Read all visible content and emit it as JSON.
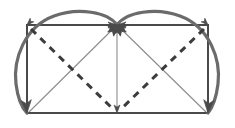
{
  "figure": {
    "canvas": {
      "width": 235,
      "height": 128,
      "background": "#ffffff"
    },
    "colors": {
      "rectangle_stroke": "#4a4a4a",
      "arc_stroke": "#6b6b6b",
      "thin_diagonal_stroke": "#8c8c8c",
      "dashed_stroke": "#3c3c3c",
      "arrowhead_fill": "#4a4a4a",
      "background": "#ffffff"
    },
    "stroke_widths": {
      "rectangle": 2.0,
      "arc": 3.2,
      "thin_diagonal": 1.1,
      "dashed": 3.0
    },
    "dash_pattern": "7 6",
    "points": {
      "top_left": {
        "label": "A",
        "x": 27,
        "y": 25
      },
      "top_center": {
        "label": "E",
        "x": 117,
        "y": 25
      },
      "top_right": {
        "label": "B",
        "x": 208,
        "y": 25
      },
      "bottom_right": {
        "label": "C",
        "x": 208,
        "y": 113
      },
      "bottom_center": {
        "label": "F",
        "x": 117,
        "y": 113
      },
      "bottom_left": {
        "label": "D",
        "x": 27,
        "y": 113
      }
    },
    "shapes": {
      "rectangle": {
        "name": "outer-rectangle",
        "path": "M 27 25 L 208 25 L 208 113 L 27 113 Z"
      },
      "left_arc": {
        "name": "left-semicircular-arc",
        "description": "arc from top-center apex over the left half down to bottom-left corner",
        "path": "M 117 25 C 108 12 78 7 54 16 C 24 27 13 60 16 84 C 18 100 22 108 27 113"
      },
      "right_arc": {
        "name": "right-semicircular-arc",
        "description": "arc from top-center apex over the right half down to bottom-right corner",
        "path": "M 117 25 C 126 12 156 7 180 16 C 210 27 221 60 218 84 C 216 100 212 108 208 113"
      },
      "thin_diagonal_left": {
        "name": "thin-diagonal-apex-to-bottom-left",
        "path": "M 117 25 L 29 112"
      },
      "thin_diagonal_right": {
        "name": "thin-diagonal-apex-to-bottom-right",
        "path": "M 117 25 L 206 112"
      },
      "thin_vertical": {
        "name": "thin-vertical-apex-to-bottom-center",
        "path": "M 117 26 L 117 110"
      },
      "dashed_diagonal_left": {
        "name": "dashed-diagonal-topleft-to-bottom-center",
        "path": "M 31 29 L 114 110"
      },
      "dashed_diagonal_right": {
        "name": "dashed-diagonal-topright-to-bottom-center",
        "path": "M 204 29 L 120 110"
      }
    },
    "arrowheads": [
      {
        "name": "arrowhead-bottom-left",
        "at_x": 27,
        "at_y": 113,
        "angle": 86,
        "size": 13,
        "weight": "large"
      },
      {
        "name": "arrowhead-bottom-right",
        "at_x": 208,
        "at_y": 113,
        "angle": 94,
        "size": 13,
        "weight": "large"
      },
      {
        "name": "arrowhead-bottom-center",
        "at_x": 117,
        "at_y": 113,
        "angle": 90,
        "size": 8,
        "weight": "small"
      },
      {
        "name": "arrowhead-apex-from-left-arc",
        "at_x": 117,
        "at_y": 25,
        "angle": -55,
        "size": 11,
        "weight": "medium"
      },
      {
        "name": "arrowhead-apex-from-right-arc",
        "at_x": 117,
        "at_y": 25,
        "angle": -125,
        "size": 11,
        "weight": "medium"
      },
      {
        "name": "arrowhead-apex-from-left-edge",
        "at_x": 117,
        "at_y": 25,
        "angle": -90,
        "size": 10,
        "weight": "medium"
      },
      {
        "name": "arrowhead-apex-from-diag-left",
        "at_x": 117,
        "at_y": 25,
        "angle": -20,
        "size": 10,
        "weight": "medium"
      },
      {
        "name": "arrowhead-apex-from-diag-right",
        "at_x": 117,
        "at_y": 25,
        "angle": -160,
        "size": 10,
        "weight": "medium"
      },
      {
        "name": "arrowhead-apex-from-top-edge-left",
        "at_x": 117,
        "at_y": 25,
        "angle": 0,
        "size": 9,
        "weight": "medium"
      },
      {
        "name": "arrowhead-apex-from-top-edge-right",
        "at_x": 117,
        "at_y": 25,
        "angle": 180,
        "size": 9,
        "weight": "medium"
      },
      {
        "name": "arrowhead-top-left-corner",
        "at_x": 27,
        "at_y": 25,
        "angle": 135,
        "size": 7,
        "weight": "small"
      },
      {
        "name": "arrowhead-top-right-corner",
        "at_x": 208,
        "at_y": 25,
        "angle": 45,
        "size": 7,
        "weight": "small"
      }
    ]
  }
}
